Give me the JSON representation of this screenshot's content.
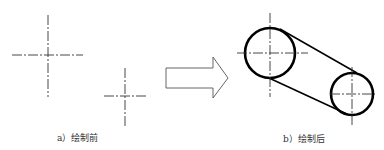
{
  "figure": {
    "before": {
      "caption": "a）绘制前",
      "centerlines": [
        {
          "name": "centerline-large"
        },
        {
          "name": "centerline-small"
        }
      ]
    },
    "arrow": {
      "direction": "right",
      "meaning": "transform"
    },
    "after": {
      "caption": "b）绘制后",
      "shapes": [
        "large-circle",
        "small-circle",
        "tangent-line-top",
        "tangent-line-bottom"
      ]
    },
    "colors": {
      "stroke": "#000000",
      "centerline": "#333333",
      "arrow": "#555555",
      "background": "#ffffff"
    }
  }
}
